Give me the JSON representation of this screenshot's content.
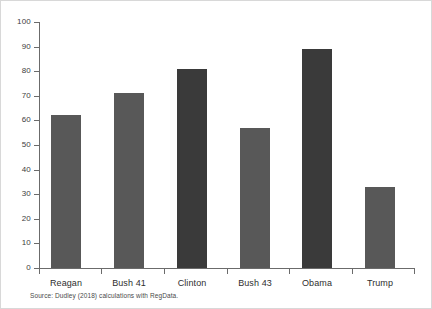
{
  "chart_data": {
    "type": "bar",
    "title": "",
    "subtitle": "",
    "xlabel": "",
    "ylabel": "",
    "categories": [
      "Reagan",
      "Bush 41",
      "Clinton",
      "Bush 43",
      "Obama",
      "Trump"
    ],
    "values": [
      62,
      71,
      81,
      57,
      89,
      33
    ],
    "series": [
      {
        "name": "",
        "values": [
          62,
          71,
          81,
          57,
          89,
          33
        ]
      }
    ],
    "bar_colors": [
      "#585858",
      "#585858",
      "#3a3a3a",
      "#585858",
      "#3a3a3a",
      "#585858"
    ],
    "ylim": [
      0,
      100
    ],
    "yticks": [
      0,
      10,
      20,
      30,
      40,
      50,
      60,
      70,
      80,
      90,
      100
    ],
    "ytick_labels": [
      "0",
      "10",
      "20",
      "30",
      "40",
      "50",
      "60",
      "70",
      "80",
      "90",
      "100"
    ],
    "grid": false,
    "legend": null,
    "annotations": [],
    "source_note": "Source: Dudley (2018) calculations with RegData."
  },
  "colors": {
    "bar_light": "#585858",
    "bar_dark": "#3a3a3a",
    "axis": "#6b6b6b",
    "text": "#2e2e2e",
    "tick_text": "#3d3d3d",
    "border": "#d8d8d8",
    "background": "#ffffff"
  }
}
